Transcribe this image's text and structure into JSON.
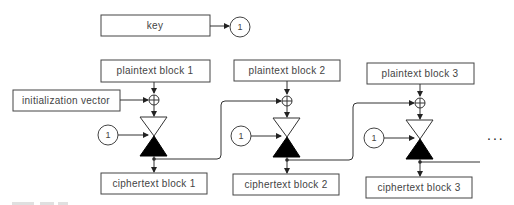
{
  "diagram": {
    "key": {
      "label": "key",
      "ref": "1"
    },
    "iv": {
      "label": "initialization vector"
    },
    "blocks": [
      {
        "plaintext": "plaintext block 1",
        "ciphertext": "ciphertext block 1",
        "key_ref": "1"
      },
      {
        "plaintext": "plaintext block 2",
        "ciphertext": "ciphertext block 2",
        "key_ref": "1"
      },
      {
        "plaintext": "plaintext block 3",
        "ciphertext": "ciphertext block 3",
        "key_ref": "1"
      }
    ],
    "continuation": "...",
    "colors": {
      "stroke": "#333333",
      "text": "#444444",
      "fill_dark": "#000000"
    }
  }
}
